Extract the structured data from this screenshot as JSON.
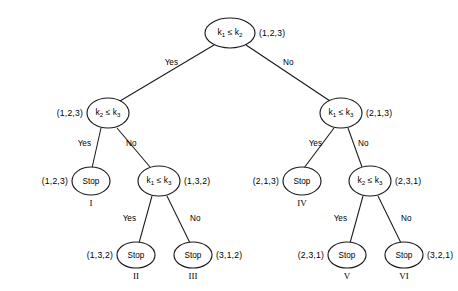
{
  "diagram": {
    "type": "decision-tree",
    "background_color": "#ffffff",
    "line_color": "#1a1a1a",
    "branch_labels": {
      "yes": "Yes",
      "no": "No"
    },
    "nodes": [
      {
        "id": "root",
        "kind": "decision",
        "label": "k₁ ≤ k₂",
        "key_a": "k",
        "sub_a": "1",
        "relation": "≤",
        "key_b": "k",
        "sub_b": "2",
        "permutation": "(1,2,3)",
        "permutation_side": "right",
        "cx": 230,
        "cy": 33,
        "rx": 25,
        "ry": 15
      },
      {
        "id": "L",
        "kind": "decision",
        "label": "k₂ ≤ k₃",
        "key_a": "k",
        "sub_a": "2",
        "relation": "≤",
        "key_b": "k",
        "sub_b": "3",
        "permutation": "(1,2,3)",
        "permutation_side": "left",
        "cx": 108,
        "cy": 113,
        "rx": 21,
        "ry": 15
      },
      {
        "id": "R",
        "kind": "decision",
        "label": "k₁ ≤ k₃",
        "key_a": "k",
        "sub_a": "1",
        "relation": "≤",
        "key_b": "k",
        "sub_b": "3",
        "permutation": "(2,1,3)",
        "permutation_side": "right",
        "cx": 341,
        "cy": 113,
        "rx": 21,
        "ry": 15
      },
      {
        "id": "LL",
        "kind": "stop",
        "label": "Stop",
        "permutation": "(1,2,3)",
        "permutation_side": "left",
        "roman": "I",
        "cx": 91,
        "cy": 181,
        "rx": 19,
        "ry": 14
      },
      {
        "id": "LR",
        "kind": "decision",
        "label": "k₁ ≤ k₃",
        "key_a": "k",
        "sub_a": "1",
        "relation": "≤",
        "key_b": "k",
        "sub_b": "3",
        "permutation": "(1,3,2)",
        "permutation_side": "right",
        "cx": 159,
        "cy": 181,
        "rx": 21,
        "ry": 15
      },
      {
        "id": "RL",
        "kind": "stop",
        "label": "Stop",
        "permutation": "(2,1,3)",
        "permutation_side": "left",
        "roman": "IV",
        "cx": 302,
        "cy": 181,
        "rx": 19,
        "ry": 14
      },
      {
        "id": "RR",
        "kind": "decision",
        "label": "k₂ ≤ k₃",
        "key_a": "k",
        "sub_a": "2",
        "relation": "≤",
        "key_b": "k",
        "sub_b": "3",
        "permutation": "(2,3,1)",
        "permutation_side": "right",
        "cx": 370,
        "cy": 181,
        "rx": 21,
        "ry": 15
      },
      {
        "id": "LRL",
        "kind": "stop",
        "label": "Stop",
        "permutation": "(1,3,2)",
        "permutation_side": "left",
        "roman": "II",
        "cx": 136,
        "cy": 255,
        "rx": 19,
        "ry": 13
      },
      {
        "id": "LRR",
        "kind": "stop",
        "label": "Stop",
        "permutation": "(3,1,2)",
        "permutation_side": "right",
        "roman": "III",
        "cx": 193,
        "cy": 255,
        "rx": 19,
        "ry": 13
      },
      {
        "id": "RRL",
        "kind": "stop",
        "label": "Stop",
        "permutation": "(2,3,1)",
        "permutation_side": "left",
        "roman": "V",
        "cx": 347,
        "cy": 255,
        "rx": 19,
        "ry": 13
      },
      {
        "id": "RRR",
        "kind": "stop",
        "label": "Stop",
        "permutation": "(3,2,1)",
        "permutation_side": "right",
        "roman": "VI",
        "cx": 404,
        "cy": 255,
        "rx": 19,
        "ry": 13
      }
    ],
    "edges": [
      {
        "id": "root-L",
        "from": "root",
        "to": "L",
        "answer": "Yes",
        "x1": 214,
        "y1": 45,
        "x2": 120,
        "y2": 101,
        "lx": 178,
        "ly": 63
      },
      {
        "id": "root-R",
        "from": "root",
        "to": "R",
        "answer": "No",
        "x1": 246,
        "y1": 45,
        "x2": 330,
        "y2": 101,
        "lx": 283,
        "ly": 63
      },
      {
        "id": "L-LL",
        "from": "L",
        "to": "LL",
        "answer": "Yes",
        "x1": 101,
        "y1": 128,
        "x2": 92,
        "y2": 168,
        "lx": 91,
        "ly": 144
      },
      {
        "id": "L-LR",
        "from": "L",
        "to": "LR",
        "answer": "No",
        "x1": 117,
        "y1": 128,
        "x2": 150,
        "y2": 167,
        "lx": 126,
        "ly": 144
      },
      {
        "id": "R-RL",
        "from": "R",
        "to": "RL",
        "answer": "Yes",
        "x1": 334,
        "y1": 128,
        "x2": 304,
        "y2": 168,
        "lx": 322,
        "ly": 144
      },
      {
        "id": "R-RR",
        "from": "R",
        "to": "RR",
        "answer": "No",
        "x1": 348,
        "y1": 128,
        "x2": 362,
        "y2": 167,
        "lx": 358,
        "ly": 144
      },
      {
        "id": "LR-LRL",
        "from": "LR",
        "to": "LRL",
        "answer": "Yes",
        "x1": 152,
        "y1": 196,
        "x2": 139,
        "y2": 243,
        "lx": 136,
        "ly": 219
      },
      {
        "id": "LR-LRR",
        "from": "LR",
        "to": "LRR",
        "answer": "No",
        "x1": 167,
        "y1": 196,
        "x2": 190,
        "y2": 243,
        "lx": 190,
        "ly": 219
      },
      {
        "id": "RR-RRL",
        "from": "RR",
        "to": "RRL",
        "answer": "Yes",
        "x1": 363,
        "y1": 196,
        "x2": 350,
        "y2": 243,
        "lx": 347,
        "ly": 219
      },
      {
        "id": "RR-RRR",
        "from": "RR",
        "to": "RRR",
        "answer": "No",
        "x1": 378,
        "y1": 196,
        "x2": 401,
        "y2": 243,
        "lx": 401,
        "ly": 219
      }
    ]
  }
}
